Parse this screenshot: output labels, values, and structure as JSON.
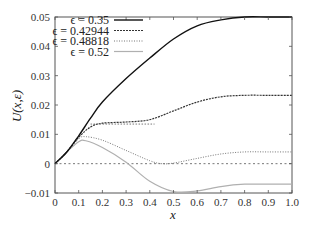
{
  "chart_data": {
    "type": "line",
    "title": "",
    "xlabel": "x",
    "ylabel": "U(x,ε)",
    "xlim": [
      0,
      1.0
    ],
    "ylim": [
      -0.01,
      0.05
    ],
    "xticks": [
      "0",
      "0.1",
      "0.2",
      "0.3",
      "0.4",
      "0.5",
      "0.6",
      "0.7",
      "0.8",
      "0.9",
      "1.0"
    ],
    "yticks": [
      "−0.01",
      "0",
      "0.01",
      "0.02",
      "0.03",
      "0.04",
      "0.05"
    ],
    "grid": false,
    "legend_position": "upper left (inside)",
    "zero_line": {
      "y": 0,
      "style": "dashed"
    },
    "series": [
      {
        "name": "ϵ = 0.35",
        "style": "solid",
        "color": "#111111",
        "x": [
          0,
          0.05,
          0.1,
          0.15,
          0.2,
          0.3,
          0.4,
          0.5,
          0.6,
          0.7,
          0.8,
          0.9,
          1.0
        ],
        "y": [
          0,
          0.004,
          0.0095,
          0.0155,
          0.021,
          0.029,
          0.036,
          0.0425,
          0.047,
          0.049,
          0.05,
          0.05,
          0.05
        ]
      },
      {
        "name": "ϵ = 0.42944",
        "style": "dashed",
        "color": "#333333",
        "x": [
          0,
          0.05,
          0.1,
          0.15,
          0.2,
          0.3,
          0.4,
          0.5,
          0.6,
          0.7,
          0.8,
          0.9,
          1.0
        ],
        "y": [
          0,
          0.004,
          0.009,
          0.0125,
          0.0138,
          0.0142,
          0.015,
          0.018,
          0.021,
          0.0228,
          0.0233,
          0.0233,
          0.0233
        ]
      },
      {
        "name": "ϵ = 0.48818",
        "style": "dotted",
        "color": "#777777",
        "x": [
          0,
          0.05,
          0.1,
          0.13,
          0.2,
          0.3,
          0.4,
          0.45,
          0.5,
          0.6,
          0.7,
          0.8,
          0.9,
          1.0
        ],
        "y": [
          0,
          0.004,
          0.0085,
          0.0092,
          0.008,
          0.0045,
          0.001,
          0,
          0.0002,
          0.0018,
          0.0033,
          0.004,
          0.004,
          0.004
        ]
      },
      {
        "name": "ϵ = 0.52",
        "style": "solid-light",
        "color": "#b0b0b0",
        "x": [
          0,
          0.05,
          0.1,
          0.13,
          0.2,
          0.3,
          0.4,
          0.5,
          0.6,
          0.7,
          0.8,
          0.9,
          1.0
        ],
        "y": [
          0,
          0.004,
          0.0075,
          0.0078,
          0.0055,
          0.0005,
          -0.006,
          -0.0095,
          -0.0093,
          -0.0078,
          -0.007,
          -0.007,
          -0.007
        ]
      }
    ],
    "annotations": [
      {
        "type": "segment",
        "style": "dotted",
        "x": [
          0.15,
          0.42
        ],
        "y": [
          0.0135,
          0.0135
        ],
        "color": "#555555"
      }
    ]
  },
  "legend": {
    "items": [
      {
        "label": "ϵ = 0.35"
      },
      {
        "label": "ϵ = 0.42944"
      },
      {
        "label": "ϵ = 0.48818"
      },
      {
        "label": "ϵ = 0.52"
      }
    ]
  },
  "axes": {
    "xlabel": "x",
    "ylabel": "U(x,ε)"
  }
}
